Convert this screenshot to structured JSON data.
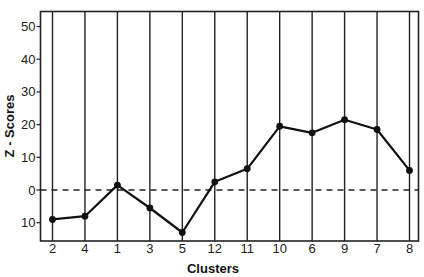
{
  "chart_data": {
    "type": "line",
    "title": "",
    "xlabel": "Clusters",
    "ylabel": "Z - Scores",
    "categories": [
      "2",
      "4",
      "1",
      "3",
      "5",
      "12",
      "11",
      "10",
      "6",
      "9",
      "7",
      "8"
    ],
    "series": [
      {
        "name": "Z-Scores",
        "values": [
          -9,
          -8,
          1.5,
          -5.5,
          -13,
          2.5,
          6.5,
          19.5,
          17.5,
          21.5,
          18.5,
          6
        ]
      }
    ],
    "ylim": [
      -15.6,
      54.6
    ],
    "yticks": [
      50,
      40,
      30,
      20,
      10,
      0,
      -10
    ],
    "ytick_labels": [
      "50",
      "40",
      "30",
      "20",
      "10",
      "0",
      "10"
    ],
    "reference_line": {
      "y": 0,
      "style": "dashed"
    },
    "grid": {
      "vertical_lines_at_categories": true,
      "horizontal": false
    },
    "legend": null,
    "colors": {
      "line": "#111111",
      "marker": "#111111",
      "axis": "#222222",
      "background": "#ffffff"
    }
  }
}
